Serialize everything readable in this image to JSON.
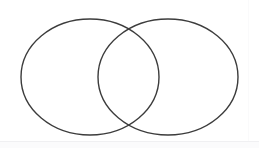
{
  "diagram": {
    "type": "venn-2-set",
    "title": "",
    "background_color": "#ffffff",
    "stroke_color": "#3c3c3c",
    "stroke_width": 1.4,
    "fill": "none",
    "canvas": {
      "width": 259,
      "height": 148
    },
    "sets": [
      {
        "name": "left-set",
        "label": "",
        "center_x": 90,
        "center_y": 77,
        "radius_x": 69,
        "radius_y": 58
      },
      {
        "name": "right-set",
        "label": "",
        "center_x": 168,
        "center_y": 77,
        "radius_x": 70,
        "radius_y": 58
      }
    ],
    "intersection": {
      "label": "",
      "upper_point_x": 127,
      "upper_point_y": 30,
      "lower_point_x": 127,
      "lower_point_y": 124
    },
    "labels": []
  }
}
